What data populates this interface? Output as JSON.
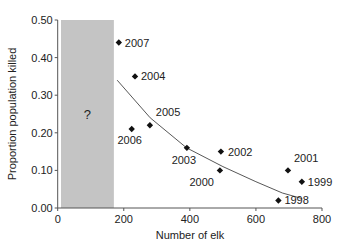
{
  "chart_data": {
    "type": "scatter",
    "title": "",
    "xlabel": "Number of elk",
    "ylabel": "Proportion population killed",
    "xlim": [
      0,
      800
    ],
    "ylim": [
      0,
      0.5
    ],
    "x_ticks": [
      "0",
      "200",
      "400",
      "600",
      "800"
    ],
    "y_ticks": [
      "0.00",
      "0.10",
      "0.20",
      "0.30",
      "0.40",
      "0.50"
    ],
    "grid": false,
    "shaded_region": {
      "x_from": 10,
      "x_to": 170,
      "label": "?"
    },
    "points": [
      {
        "label": "2007",
        "x": 185,
        "y": 0.44
      },
      {
        "label": "2004",
        "x": 234,
        "y": 0.35
      },
      {
        "label": "2006",
        "x": 224,
        "y": 0.21
      },
      {
        "label": "2005",
        "x": 279,
        "y": 0.22
      },
      {
        "label": "2003",
        "x": 391,
        "y": 0.16
      },
      {
        "label": "2002",
        "x": 494,
        "y": 0.15
      },
      {
        "label": "2000",
        "x": 491,
        "y": 0.1
      },
      {
        "label": "2001",
        "x": 697,
        "y": 0.1
      },
      {
        "label": "1999",
        "x": 739,
        "y": 0.07
      },
      {
        "label": "1998",
        "x": 668,
        "y": 0.02
      }
    ],
    "trend_line": [
      {
        "x": 180,
        "y": 0.34
      },
      {
        "x": 280,
        "y": 0.24
      },
      {
        "x": 390,
        "y": 0.16
      },
      {
        "x": 500,
        "y": 0.11
      },
      {
        "x": 600,
        "y": 0.07
      },
      {
        "x": 680,
        "y": 0.04
      },
      {
        "x": 740,
        "y": 0.025
      }
    ]
  }
}
